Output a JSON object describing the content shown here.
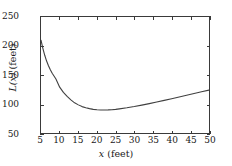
{
  "chart_data": {
    "type": "line",
    "title": "",
    "subtitle": "",
    "xlabel": "x (feet)",
    "ylabel": "L(x) (feet)",
    "xlabel_italic_part": "x",
    "xlabel_rest": " (feet)",
    "ylabel_italic_part": "L(x)",
    "ylabel_rest": " (feet)",
    "xlim": [
      5,
      50
    ],
    "ylim": [
      50,
      250
    ],
    "xticks": [
      5,
      10,
      15,
      20,
      25,
      30,
      35,
      40,
      45,
      50
    ],
    "yticks": [
      50,
      100,
      150,
      200,
      250
    ],
    "xtick_labels": [
      "5",
      "10",
      "15",
      "20",
      "25",
      "30",
      "35",
      "40",
      "45",
      "50"
    ],
    "ytick_labels": [
      "50",
      "100",
      "150",
      "200",
      "250"
    ],
    "grid": false,
    "legend": null,
    "legend_position": "none",
    "frame": "box",
    "tick_direction": "in",
    "line_color": "#404040",
    "line_width": 1.1,
    "series": [
      {
        "name": "L(x)",
        "x": [
          5,
          5.5,
          6,
          6.5,
          7,
          7.5,
          8,
          9,
          10,
          11,
          12,
          13,
          14,
          15,
          16,
          17,
          18,
          19,
          20,
          21,
          22,
          23,
          24,
          25,
          26,
          28,
          30,
          32,
          34,
          36,
          38,
          40,
          42,
          44,
          46,
          48,
          50
        ],
        "values": [
          210,
          196,
          184.5,
          175,
          167,
          160.5,
          155,
          146,
          139,
          133.5,
          129,
          125,
          122,
          119.5,
          117,
          115,
          113,
          111.5,
          110,
          108.8,
          108,
          108,
          108,
          108.5,
          109,
          110.5,
          112.5,
          115,
          117.5,
          120,
          122.5,
          125.5,
          128.5,
          131.5,
          134.5,
          137.5,
          141
        ],
        "values_plot": [
          210,
          196,
          184,
          174,
          166,
          159,
          153,
          143,
          129,
          120,
          113,
          107,
          102,
          98.5,
          95.5,
          93.5,
          92,
          90.8,
          90.1,
          89.7,
          89.6,
          89.8,
          90.2,
          90.8,
          91.6,
          93.4,
          95.6,
          98.1,
          100.7,
          103.4,
          106.2,
          109.1,
          112,
          115,
          118,
          121,
          124
        ]
      }
    ],
    "minimum": {
      "x": 22,
      "y": 89.6
    },
    "start_point": {
      "x": 5,
      "y": 210
    },
    "end_point": {
      "x": 50,
      "y": 124
    }
  },
  "figure": {
    "background_color": "#ffffff",
    "frame_color": "#3a3a3a"
  }
}
